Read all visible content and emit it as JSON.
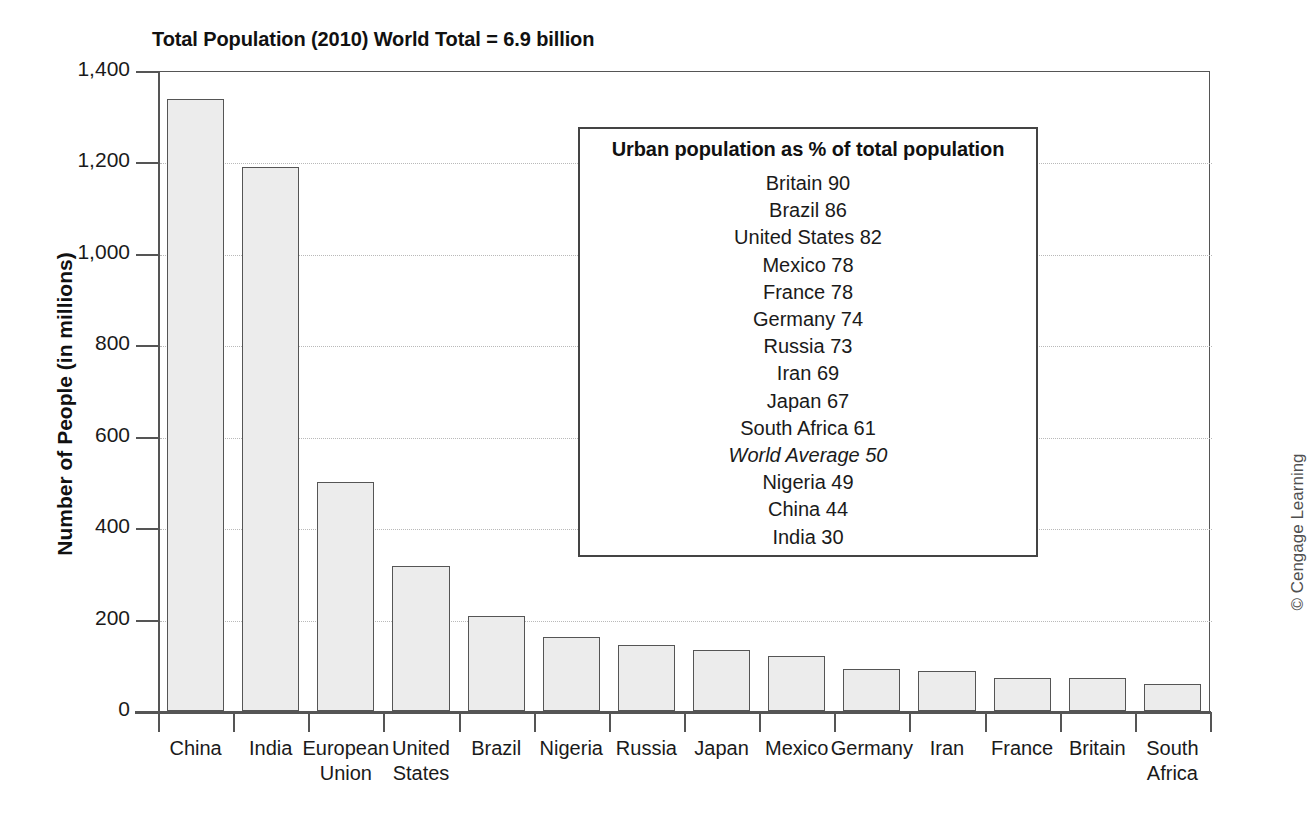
{
  "chart_data": {
    "type": "bar",
    "title": "Total Population (2010) World Total = 6.9 billion",
    "xlabel": "",
    "ylabel": "Number of People (in millions)",
    "ylim": [
      0,
      1400
    ],
    "ytick_values": [
      0,
      200,
      400,
      600,
      800,
      1000,
      1200,
      1400
    ],
    "ytick_labels": [
      "0",
      "200",
      "400",
      "600",
      "800",
      "1,000",
      "1,200",
      "1,400"
    ],
    "grid": "horizontal-dotted",
    "legend_position": "inside-upper-right",
    "categories": [
      "China",
      "India",
      "European Union",
      "United States",
      "Brazil",
      "Nigeria",
      "Russia",
      "Japan",
      "Mexico",
      "Germany",
      "Iran",
      "France",
      "Britain",
      "South Africa"
    ],
    "category_lines": [
      [
        "China"
      ],
      [
        "India"
      ],
      [
        "European",
        "Union"
      ],
      [
        "United",
        "States"
      ],
      [
        "Brazil"
      ],
      [
        "Nigeria"
      ],
      [
        "Russia"
      ],
      [
        "Japan"
      ],
      [
        "Mexico"
      ],
      [
        "Germany"
      ],
      [
        "Iran"
      ],
      [
        "France"
      ],
      [
        "Britain"
      ],
      [
        "South",
        "Africa"
      ]
    ],
    "values": [
      1338,
      1189,
      501,
      318,
      208,
      162,
      145,
      134,
      120,
      92,
      88,
      73,
      73,
      60
    ],
    "bar_fill": "#ececec",
    "bar_edge": "#555555",
    "annotation": {
      "title": "Urban population as % of total population",
      "entries": [
        {
          "label": "Britain",
          "value": 90,
          "text": "Britain 90",
          "italic": false
        },
        {
          "label": "Brazil",
          "value": 86,
          "text": "Brazil 86",
          "italic": false
        },
        {
          "label": "United States",
          "value": 82,
          "text": "United States 82",
          "italic": false
        },
        {
          "label": "Mexico",
          "value": 78,
          "text": "Mexico 78",
          "italic": false
        },
        {
          "label": "France",
          "value": 78,
          "text": "France 78",
          "italic": false
        },
        {
          "label": "Germany",
          "value": 74,
          "text": "Germany 74",
          "italic": false
        },
        {
          "label": "Russia",
          "value": 73,
          "text": "Russia 73",
          "italic": false
        },
        {
          "label": "Iran",
          "value": 69,
          "text": "Iran 69",
          "italic": false
        },
        {
          "label": "Japan",
          "value": 67,
          "text": "Japan 67",
          "italic": false
        },
        {
          "label": "South Africa",
          "value": 61,
          "text": "South Africa 61",
          "italic": false
        },
        {
          "label": "World Average",
          "value": 50,
          "text": "World Average 50",
          "italic": true
        },
        {
          "label": "Nigeria",
          "value": 49,
          "text": "Nigeria 49",
          "italic": false
        },
        {
          "label": "China",
          "value": 44,
          "text": "China 44",
          "italic": false
        },
        {
          "label": "India",
          "value": 30,
          "text": "India 30",
          "italic": false
        }
      ]
    }
  },
  "credit": "© Cengage Learning"
}
